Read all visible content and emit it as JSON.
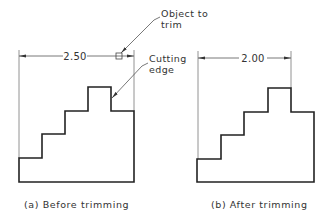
{
  "figure_a": {
    "dimension_label": "2.50",
    "annotation_object": [
      "Object to",
      "trim"
    ],
    "annotation_cutting": [
      "Cutting",
      "edge"
    ],
    "caption": "(a) Before trimming"
  },
  "figure_b": {
    "dimension_label": "2.00",
    "caption": "(b) After trimming"
  },
  "colors": {
    "outline": "#222222",
    "dimension": "#555555",
    "text": "#333333",
    "background": "#ffffff"
  }
}
